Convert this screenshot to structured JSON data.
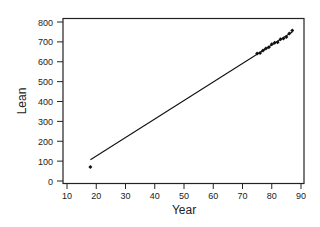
{
  "chart_data": {
    "type": "scatter",
    "title": "",
    "xlabel": "Year",
    "ylabel": "Lean",
    "xlim": [
      10,
      90
    ],
    "ylim": [
      0,
      800
    ],
    "xticks": [
      10,
      20,
      30,
      40,
      50,
      60,
      70,
      80,
      90
    ],
    "yticks": [
      0,
      100,
      200,
      300,
      400,
      500,
      600,
      700,
      800
    ],
    "grid": false,
    "legend": null,
    "series": [
      {
        "name": "Observed",
        "kind": "points",
        "x": [
          18,
          75,
          76,
          77,
          78,
          79,
          80,
          81,
          82,
          83,
          84,
          85,
          86,
          87
        ],
        "y": [
          71,
          642,
          644,
          656,
          667,
          673,
          688,
          696,
          698,
          713,
          717,
          725,
          742,
          757
        ]
      },
      {
        "name": "Fitted line",
        "kind": "line",
        "x": [
          18,
          87
        ],
        "y": [
          107,
          750
        ]
      }
    ]
  },
  "colors": {
    "axis": "#222222",
    "points": "#111111",
    "line": "#111111",
    "background": "#ffffff"
  }
}
